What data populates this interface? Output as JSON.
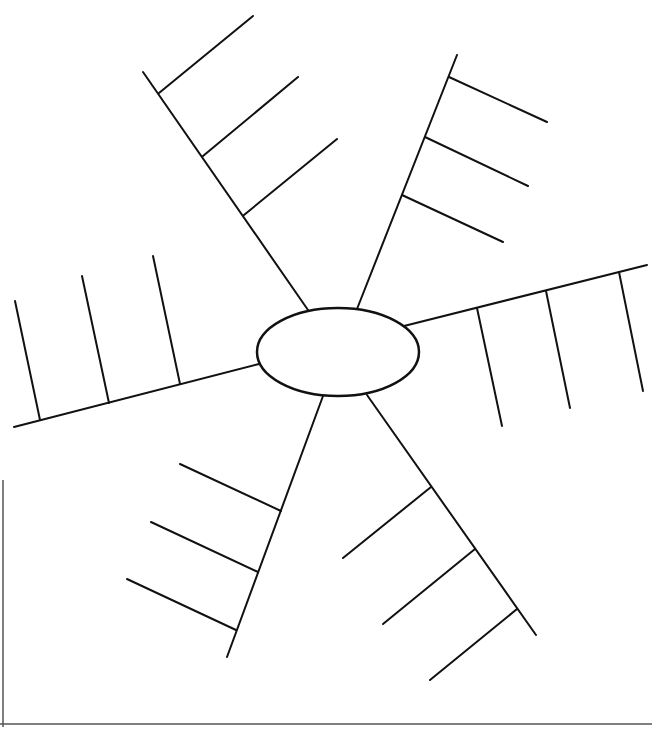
{
  "diagram": {
    "type": "spider-map",
    "stroke_color": "#111111",
    "background": "#ffffff",
    "center": {
      "cx": 338,
      "cy": 352,
      "rx": 81,
      "ry": 44,
      "label": ""
    },
    "spokes": [
      {
        "id": "top-left",
        "line": [
          308,
          310,
          143,
          72
        ],
        "branches": [
          [
            159,
            93,
            253,
            16
          ],
          [
            203,
            156,
            298,
            77
          ],
          [
            244,
            215,
            337,
            139
          ]
        ]
      },
      {
        "id": "top-right",
        "line": [
          357,
          309,
          457,
          55
        ],
        "branches": [
          [
            449,
            77,
            547,
            122
          ],
          [
            425,
            137,
            528,
            186
          ],
          [
            402,
            195,
            503,
            242
          ]
        ]
      },
      {
        "id": "right",
        "line": [
          404,
          326,
          647,
          265
        ],
        "branches": [
          [
            477,
            308,
            502,
            426
          ],
          [
            546,
            291,
            570,
            408
          ],
          [
            619,
            272,
            643,
            391
          ]
        ]
      },
      {
        "id": "bottom-right",
        "line": [
          367,
          395,
          536,
          635
        ],
        "branches": [
          [
            431,
            487,
            343,
            558
          ],
          [
            475,
            549,
            383,
            624
          ],
          [
            517,
            609,
            430,
            680
          ]
        ]
      },
      {
        "id": "bottom-left",
        "line": [
          323,
          396,
          227,
          657
        ],
        "branches": [
          [
            281,
            511,
            180,
            464
          ],
          [
            258,
            572,
            151,
            522
          ],
          [
            236,
            630,
            127,
            579
          ]
        ]
      },
      {
        "id": "left",
        "line": [
          259,
          364,
          14,
          427
        ],
        "branches": [
          [
            180,
            384,
            153,
            256
          ],
          [
            109,
            403,
            82,
            276
          ],
          [
            40,
            420,
            15,
            301
          ]
        ]
      }
    ],
    "frame_lines": [
      [
        3,
        480,
        3,
        727
      ],
      [
        0,
        724,
        652,
        724
      ]
    ]
  }
}
